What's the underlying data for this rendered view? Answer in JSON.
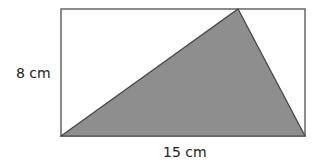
{
  "diagram": {
    "type": "geometry",
    "rectangle": {
      "x": 61,
      "y": 9,
      "width": 244,
      "height": 127,
      "stroke": "#666666",
      "fill": "#ffffff"
    },
    "triangle": {
      "points": "61,136 238,9 305,136",
      "fill": "#8e8e8e",
      "stroke": "#444444"
    },
    "labels": {
      "height": "8 cm",
      "width": "15 cm"
    },
    "dimensions": {
      "height_cm": 8,
      "width_cm": 15
    }
  }
}
